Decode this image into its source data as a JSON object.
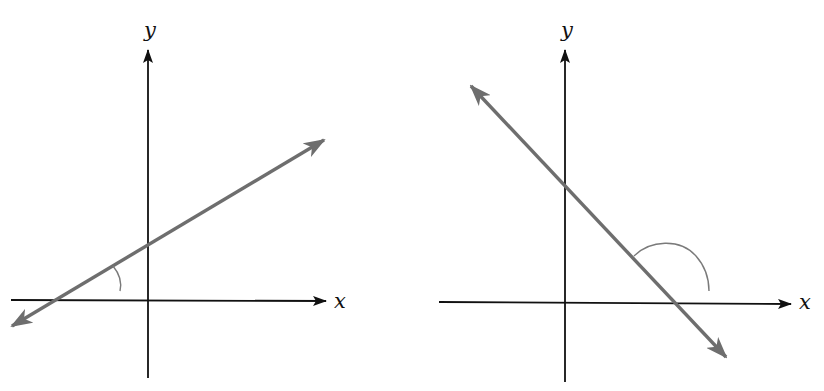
{
  "figure": {
    "panels": [
      {
        "id": "left",
        "description": "Line with positive slope; acute inclination angle marked",
        "x_axis_label": "x",
        "y_axis_label": "y",
        "line_slope_sign": "positive",
        "angle_type": "acute"
      },
      {
        "id": "right",
        "description": "Line with negative slope; obtuse inclination angle marked",
        "x_axis_label": "x",
        "y_axis_label": "y",
        "line_slope_sign": "negative",
        "angle_type": "obtuse"
      }
    ],
    "colors": {
      "axis": "#111111",
      "line": "#6e6e6e",
      "arc": "#7a7a7a",
      "background": "#ffffff"
    }
  }
}
